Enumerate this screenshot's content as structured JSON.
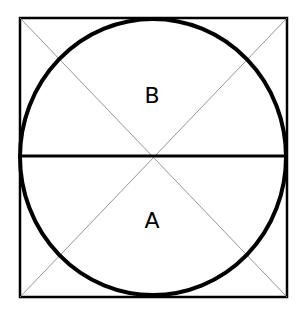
{
  "diagram": {
    "square": {
      "x1": 20,
      "y1": 18,
      "x2": 287,
      "y2": 297,
      "stroke": "#000000",
      "stroke_width": 2.5
    },
    "circle": {
      "cx": 153,
      "cy": 157,
      "r": 133,
      "stroke": "#000000",
      "stroke_width": 4
    },
    "horizontal_diameter": {
      "y": 157,
      "stroke_width": 3
    },
    "diagonals_color": "#8a8a8a",
    "labels": [
      {
        "text": "B",
        "x": 152,
        "y": 96
      },
      {
        "text": "A",
        "x": 152,
        "y": 221
      }
    ]
  }
}
